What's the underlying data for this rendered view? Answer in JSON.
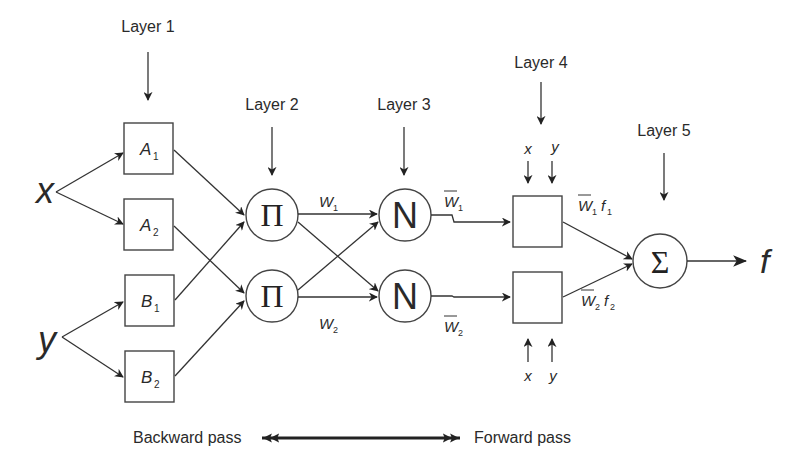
{
  "diagram": {
    "type": "ANFIS architecture",
    "layers": [
      {
        "label": "Layer  1",
        "x": 148,
        "label_y": 32,
        "arrow_y1": 52,
        "arrow_y2": 100
      },
      {
        "label": "Layer  2",
        "x": 272,
        "label_y": 110,
        "arrow_y1": 127,
        "arrow_y2": 175
      },
      {
        "label": "Layer  3",
        "x": 404,
        "label_y": 110,
        "arrow_y1": 127,
        "arrow_y2": 175
      },
      {
        "label": "Layer  4",
        "x": 541,
        "label_y": 68,
        "arrow_y1": 82,
        "arrow_y2": 124
      },
      {
        "label": "Layer  5",
        "x": 664,
        "label_y": 136,
        "arrow_y1": 153,
        "arrow_y2": 200
      }
    ],
    "inputs": [
      {
        "id": "x",
        "label": "x",
        "x": 48,
        "y": 192
      },
      {
        "id": "y",
        "label": "y",
        "x": 50,
        "y": 343
      }
    ],
    "layer1_nodes": [
      {
        "id": "A1",
        "label": "A",
        "sub": "1",
        "x": 124,
        "y": 123
      },
      {
        "id": "A2",
        "label": "A",
        "sub": "2",
        "x": 124,
        "y": 199
      },
      {
        "id": "B1",
        "label": "B",
        "sub": "1",
        "x": 124,
        "y": 275
      },
      {
        "id": "B2",
        "label": "B",
        "sub": "2",
        "x": 124,
        "y": 351
      }
    ],
    "layer2_nodes": [
      {
        "id": "P1",
        "symbol": "Π",
        "cx": 272,
        "cy": 215
      },
      {
        "id": "P2",
        "symbol": "Π",
        "cx": 272,
        "cy": 296
      }
    ],
    "layer2_outputs": [
      {
        "label": "W",
        "sub": "1",
        "x": 319,
        "y": 203
      },
      {
        "label": "W",
        "sub": "2",
        "x": 319,
        "y": 330
      }
    ],
    "layer3_nodes": [
      {
        "id": "N1",
        "symbol": "N",
        "cx": 405,
        "cy": 215
      },
      {
        "id": "N2",
        "symbol": "N",
        "cx": 405,
        "cy": 296
      }
    ],
    "layer3_outputs": [
      {
        "label": "W",
        "sub": "1",
        "overline": true,
        "x": 444,
        "y": 205
      },
      {
        "label": "W",
        "sub": "2",
        "overline": true,
        "x": 444,
        "y": 332
      }
    ],
    "layer4_nodes": [
      {
        "id": "R1",
        "x": 512,
        "y": 196,
        "inputs": [
          "x",
          "y"
        ],
        "input_side": "top"
      },
      {
        "id": "R2",
        "x": 512,
        "y": 272,
        "inputs": [
          "x",
          "y"
        ],
        "input_side": "bottom"
      }
    ],
    "layer4_outputs": [
      {
        "label": "W",
        "sub": "1",
        "f": "f",
        "fsub": "1",
        "x": 578,
        "y": 218
      },
      {
        "label": "W",
        "sub": "2",
        "f": "f",
        "fsub": "2",
        "x": 580,
        "y": 306
      }
    ],
    "layer5_node": {
      "id": "S",
      "symbol": "Σ",
      "cx": 660,
      "cy": 261
    },
    "output": {
      "label": "f",
      "x": 760,
      "y": 271
    },
    "passes": {
      "backward": "Backward pass",
      "forward": "Forward pass"
    }
  }
}
